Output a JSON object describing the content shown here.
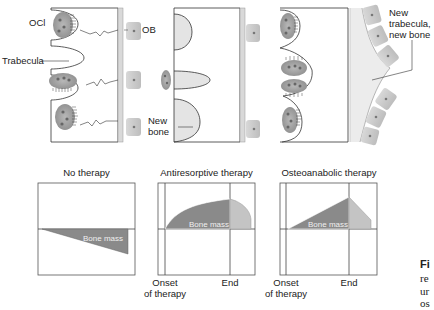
{
  "top_panels": {
    "labels": {
      "ocl": "OCl",
      "ob": "OB",
      "trabecula": "Trabecula",
      "new_bone": "New\nbone",
      "new_bone_line1": "New",
      "new_bone_line2": "bone",
      "new_trabecula_line1": "New",
      "new_trabecula_line2": "trabecula,",
      "new_trabecula_line3": "new bone"
    }
  },
  "charts": [
    {
      "title": "No therapy",
      "area_label": "Bone mass",
      "x_labels": []
    },
    {
      "title": "Antiresorptive therapy",
      "area_label": "Bone mass",
      "x_labels": [
        "Onset",
        "of therapy",
        "End"
      ]
    },
    {
      "title": "Osteoanabolic therapy",
      "area_label": "Bone mass",
      "x_labels": [
        "Onset",
        "of therapy",
        "End"
      ]
    }
  ],
  "chart_labels": {
    "onset_line1": "Onset",
    "onset_line2": "of therapy",
    "end": "End"
  },
  "caption": {
    "bold": "Fi",
    "line2": "re",
    "line3": "ur",
    "line4": "os"
  },
  "colors": {
    "bone_dark": "#8a8a8a",
    "bone_light": "#c4c4c4",
    "fill_light": "#e4e4e4",
    "cell": "#9a9a9a",
    "stroke": "#333333"
  }
}
